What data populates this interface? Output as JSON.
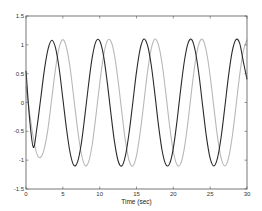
{
  "chart_data": {
    "type": "line",
    "title": "",
    "xlabel": "Time (sec)",
    "ylabel": "",
    "xlim": [
      0,
      30
    ],
    "ylim": [
      -1.5,
      1.5
    ],
    "grid": false,
    "legend": null,
    "x_ticks": [
      "0",
      "5",
      "10",
      "15",
      "20",
      "25",
      "30"
    ],
    "y_ticks": [
      "-1.5",
      "-1",
      "-0.5",
      "0",
      "0.5",
      "1",
      "1.5"
    ],
    "x": [
      0,
      0.5,
      1,
      1.5,
      2,
      2.5,
      3,
      3.5,
      4,
      4.5,
      5,
      5.5,
      6,
      6.5,
      7,
      7.5,
      8,
      8.5,
      9,
      9.5,
      10,
      10.5,
      11,
      11.5,
      12,
      12.5,
      13,
      13.5,
      14,
      14.5,
      15,
      15.5,
      16,
      16.5,
      17,
      17.5,
      18,
      18.5,
      19,
      19.5,
      20,
      20.5,
      21,
      21.5,
      22,
      22.5,
      23,
      23.5,
      24,
      24.5,
      25,
      25.5,
      26,
      26.5,
      27,
      27.5,
      28,
      28.5,
      29,
      29.5,
      30
    ],
    "series": [
      {
        "name": "signal (dark)",
        "color": "#2a2a2a",
        "values": [
          0.55,
          -0.3,
          -0.78,
          -0.42,
          0.07,
          0.57,
          0.93,
          1.08,
          0.95,
          0.59,
          0.07,
          -0.46,
          -0.88,
          -1.09,
          -1.03,
          -0.72,
          -0.22,
          0.32,
          0.79,
          1.06,
          1.07,
          0.83,
          0.38,
          -0.16,
          -0.67,
          -1.01,
          -1.1,
          -0.92,
          -0.52,
          0.0,
          0.53,
          0.93,
          1.1,
          0.99,
          0.65,
          0.14,
          -0.41,
          -0.85,
          -1.08,
          -1.06,
          -0.79,
          -0.32,
          0.23,
          0.72,
          1.03,
          1.09,
          0.88,
          0.46,
          -0.08,
          -0.6,
          -0.97,
          -1.1,
          -0.96,
          -0.59,
          -0.07,
          0.47,
          0.89,
          1.09,
          1.03,
          0.71,
          0.4
        ]
      },
      {
        "name": "signal (light)",
        "color": "#b8b8b8",
        "values": [
          0.28,
          -0.19,
          -0.62,
          -0.9,
          -0.95,
          -0.79,
          -0.44,
          0.07,
          0.58,
          0.95,
          1.09,
          0.95,
          0.59,
          0.07,
          -0.46,
          -0.88,
          -1.09,
          -1.03,
          -0.72,
          -0.22,
          0.32,
          0.79,
          1.06,
          1.07,
          0.83,
          0.38,
          -0.16,
          -0.67,
          -1.01,
          -1.1,
          -0.92,
          -0.52,
          0.0,
          0.53,
          0.93,
          1.1,
          0.99,
          0.65,
          0.14,
          -0.41,
          -0.85,
          -1.08,
          -1.06,
          -0.79,
          -0.32,
          0.23,
          0.72,
          1.03,
          1.09,
          0.88,
          0.46,
          -0.08,
          -0.6,
          -0.97,
          -1.1,
          -0.96,
          -0.59,
          -0.07,
          0.47,
          0.89,
          1.09
        ]
      }
    ]
  },
  "axes": {
    "xlabel": "Time (sec)"
  }
}
